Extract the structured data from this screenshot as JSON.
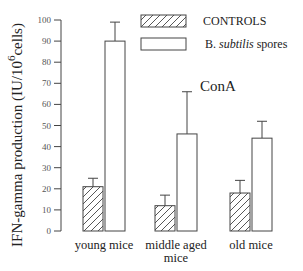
{
  "chart_data": {
    "type": "bar",
    "title": "",
    "annotation": "ConA",
    "xlabel": "",
    "ylabel": "IFN-gamma production (IU/10^6 cells)",
    "ylabel_parts": {
      "main": "IFN-gamma production (IU/10",
      "sup": "6",
      "tail": "cells)"
    },
    "ylim": [
      0,
      100
    ],
    "yticks": [
      0,
      10,
      20,
      30,
      40,
      50,
      60,
      70,
      80,
      90,
      100
    ],
    "grid": false,
    "legend_position": "top-right",
    "categories": [
      "young mice",
      "middle aged mice",
      "old mice"
    ],
    "category_label_lines": [
      [
        "young mice"
      ],
      [
        "middle aged",
        "mice"
      ],
      [
        "old mice"
      ]
    ],
    "series": [
      {
        "name": "CONTROLS",
        "fill": "hatched",
        "values": [
          21,
          12,
          18
        ],
        "error_upper": [
          25,
          17,
          24
        ]
      },
      {
        "name": "B. subtilis spores",
        "name_parts": {
          "prefix": "B. ",
          "italic": "subtilis",
          "suffix": " spores"
        },
        "fill": "open",
        "values": [
          90,
          46,
          44
        ],
        "error_upper": [
          99,
          66,
          52
        ]
      }
    ]
  },
  "legend": {
    "controls_label": "CONTROLS",
    "spores_prefix": "B. ",
    "spores_italic": "subtilis",
    "spores_suffix": " spores"
  },
  "colors": {
    "stroke": "#444444",
    "background": "#ffffff",
    "hatch": "#444444"
  }
}
